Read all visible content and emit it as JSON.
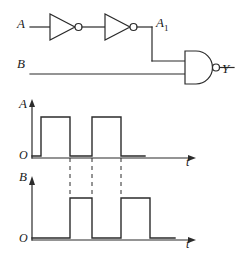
{
  "figure": {
    "stroke_color": "#2b2b2b",
    "background": "#ffffff"
  },
  "circuit": {
    "input_a_label": "A",
    "input_b_label": "B",
    "node_a1_label": "A",
    "node_a1_sub": "1",
    "output_label": "Y",
    "gates": [
      {
        "name": "inverter-1",
        "type": "NOT",
        "x": 50,
        "y": 27
      },
      {
        "name": "inverter-2",
        "type": "NOT",
        "x": 105,
        "y": 27
      },
      {
        "name": "nand-gate",
        "type": "NAND",
        "x": 185,
        "y": 68
      }
    ]
  },
  "waveform_a": {
    "signal_label": "A",
    "origin_label": "O",
    "time_label": "t"
  },
  "waveform_b": {
    "signal_label": "B",
    "origin_label": "O",
    "time_label": "t"
  },
  "chart_data": [
    {
      "type": "line",
      "name": "waveform-A",
      "title": "A",
      "xlabel": "t",
      "ylabel": "A",
      "ylim": [
        0,
        1
      ],
      "xlim": [
        0,
        165
      ],
      "grid": false,
      "legend": null,
      "digital_levels": [
        "0",
        "1"
      ],
      "x": [
        32,
        41,
        41,
        70,
        70,
        92,
        92,
        121,
        121,
        145
      ],
      "values": [
        0,
        0,
        1,
        1,
        0,
        0,
        1,
        1,
        0,
        0
      ],
      "transitions": [
        {
          "t": 41,
          "edge": "rise"
        },
        {
          "t": 70,
          "edge": "fall"
        },
        {
          "t": 92,
          "edge": "rise"
        },
        {
          "t": 121,
          "edge": "fall"
        }
      ]
    },
    {
      "type": "line",
      "name": "waveform-B",
      "title": "B",
      "xlabel": "t",
      "ylabel": "B",
      "ylim": [
        0,
        1
      ],
      "xlim": [
        0,
        165
      ],
      "grid": false,
      "legend": null,
      "digital_levels": [
        "0",
        "1"
      ],
      "x": [
        32,
        70,
        70,
        92,
        92,
        121,
        121,
        150,
        150,
        175
      ],
      "values": [
        0,
        0,
        1,
        1,
        0,
        0,
        1,
        1,
        0,
        0
      ],
      "transitions": [
        {
          "t": 70,
          "edge": "rise"
        },
        {
          "t": 92,
          "edge": "fall"
        },
        {
          "t": 121,
          "edge": "rise"
        },
        {
          "t": 150,
          "edge": "fall"
        }
      ]
    }
  ],
  "guides": {
    "dashed_times": [
      70,
      92,
      121
    ]
  }
}
